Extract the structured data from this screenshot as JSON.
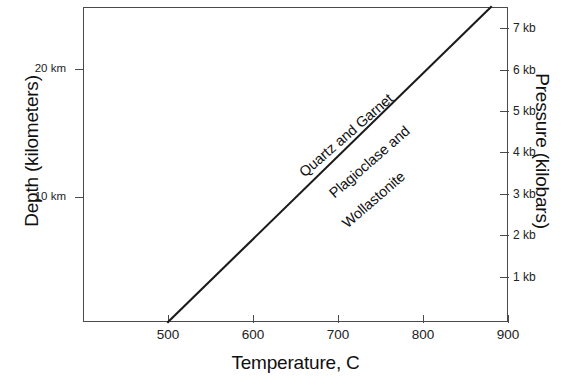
{
  "chart_data": {
    "type": "line",
    "title": "",
    "xlabel": "Temperature, C",
    "ylabel_left": "Depth (kilometers)",
    "ylabel_right": "Pressure (kilobars)",
    "xlim": [
      400,
      900
    ],
    "ylim_left_km": [
      0,
      27
    ],
    "ylim_right_kb": [
      0,
      7.6
    ],
    "grid": false,
    "legend": "none",
    "x_ticks": [
      {
        "value": 500,
        "label": "500"
      },
      {
        "value": 600,
        "label": "600"
      },
      {
        "value": 700,
        "label": "700"
      },
      {
        "value": 800,
        "label": "800"
      },
      {
        "value": 900,
        "label": "900"
      }
    ],
    "y_ticks_left": [
      {
        "value": 10,
        "label": "10 km"
      },
      {
        "value": 20,
        "label": "20 km"
      }
    ],
    "y_ticks_right": [
      {
        "value": 1,
        "label": "1 kb"
      },
      {
        "value": 2,
        "label": "2 kb"
      },
      {
        "value": 3,
        "label": "3 kb"
      },
      {
        "value": 4,
        "label": "4 kb"
      },
      {
        "value": 5,
        "label": "5 kb"
      },
      {
        "value": 6,
        "label": "6 kb"
      },
      {
        "value": 7,
        "label": "7 kb"
      }
    ],
    "series": [
      {
        "name": "reaction-boundary",
        "type": "line",
        "color": "#1a1a1a",
        "points": [
          {
            "x": 500,
            "y_kb": 0.0
          },
          {
            "x": 880,
            "y_kb": 7.6
          }
        ]
      }
    ],
    "annotations": [
      {
        "name": "field-upper",
        "text": "Quartz and Garnet",
        "rotation": -41
      },
      {
        "name": "field-lower-line1",
        "text": "Plagioclase and",
        "rotation": -41
      },
      {
        "name": "field-lower-line2",
        "text": "Wollastonite",
        "rotation": -41
      }
    ]
  },
  "axes": {
    "x_title": "Temperature, C",
    "y_left_title": "Depth (kilometers)",
    "y_right_title": "Pressure (kilobars)"
  },
  "colors": {
    "line": "#1a1a1a",
    "frame": "#4a4a4a",
    "background": "#ffffff",
    "text": "#111111"
  }
}
